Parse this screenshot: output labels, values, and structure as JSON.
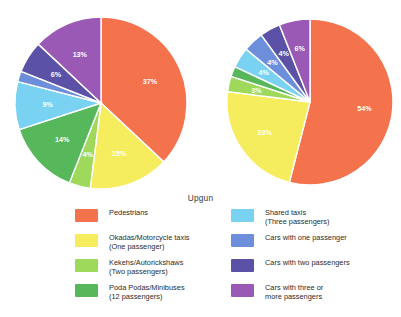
{
  "title": "Upgun",
  "colors": {
    "pedestrians": "#f4724c",
    "okadas": "#f6ed5e",
    "kekehs": "#9ed95c",
    "poda_podas": "#56b85a",
    "shared_taxis": "#79d2f2",
    "cars_one": "#6d8fdb",
    "cars_two": "#5b52a8",
    "cars_three_plus": "#9b59b6"
  },
  "legend": {
    "left_column": [
      {
        "label": "Pedestrians",
        "color_key": "pedestrians"
      },
      {
        "label": "Okadas/Motorcycle taxis\n(One passenger)",
        "color_key": "okadas"
      },
      {
        "label": "Kekehs/Autorickshaws\n(Two passengers)",
        "color_key": "kekehs"
      },
      {
        "label": "Poda Podas/Minibuses\n(12 passengers)",
        "color_key": "poda_podas"
      }
    ],
    "right_column": [
      {
        "label": "Shared taxis\n(Three passengers)",
        "color_key": "shared_taxis"
      },
      {
        "label": "Cars with one passenger",
        "color_key": "cars_one"
      },
      {
        "label": "Cars with two passengers",
        "color_key": "cars_two"
      },
      {
        "label": "Cars with three or\nmore passengers",
        "color_key": "cars_three_plus"
      }
    ]
  },
  "chart_data": [
    {
      "type": "pie",
      "name": "left-pie",
      "title": "",
      "start_angle_deg": 0,
      "direction": "clockwise",
      "categories": [
        "Pedestrians",
        "Okadas/Motorcycle taxis (One passenger)",
        "Kekehs/Autorickshaws (Two passengers)",
        "Poda Podas/Minibuses (12 passengers)",
        "Shared taxis (Three passengers)",
        "Cars with one passenger",
        "Cars with two passengers",
        "Cars with three or more passengers"
      ],
      "values": [
        37,
        15,
        4,
        14,
        9,
        2,
        6,
        13
      ],
      "labels": [
        "37%",
        "15%",
        "4%",
        "14%",
        "9%",
        "2%",
        "6%",
        "13%"
      ],
      "label_placement": [
        "inside",
        "inside",
        "inside",
        "inside",
        "inside",
        "outside",
        "inside",
        "inside"
      ],
      "colors": [
        "#f4724c",
        "#f6ed5e",
        "#9ed95c",
        "#56b85a",
        "#79d2f2",
        "#6d8fdb",
        "#5b52a8",
        "#9b59b6"
      ],
      "unit": "%"
    },
    {
      "type": "pie",
      "name": "right-pie",
      "title": "",
      "start_angle_deg": 0,
      "direction": "clockwise",
      "categories": [
        "Pedestrians",
        "Okadas/Motorcycle taxis (One passenger)",
        "Kekehs/Autorickshaws (Two passengers)",
        "Poda Podas/Minibuses (12 passengers)",
        "Shared taxis (Three passengers)",
        "Cars with one passenger",
        "Cars with two passengers",
        "Cars with three or more passengers"
      ],
      "values": [
        54,
        23,
        3,
        2,
        4,
        4,
        4,
        6
      ],
      "labels": [
        "54%",
        "23%",
        "3%",
        "2%",
        "4%",
        "4%",
        "4%",
        "6%"
      ],
      "label_placement": [
        "inside",
        "inside",
        "inside",
        "outside",
        "inside",
        "inside",
        "inside",
        "inside"
      ],
      "colors": [
        "#f4724c",
        "#f6ed5e",
        "#9ed95c",
        "#56b85a",
        "#79d2f2",
        "#6d8fdb",
        "#5b52a8",
        "#9b59b6"
      ],
      "unit": "%"
    }
  ]
}
